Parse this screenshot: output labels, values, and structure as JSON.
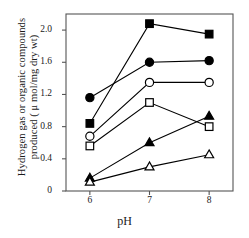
{
  "chart_data": {
    "type": "line",
    "title": "",
    "xlabel": "pH",
    "ylabel_line1": "Hydrogen gas or organic compounds",
    "ylabel_line2": "produced ( μ mol/mg dry wt)",
    "ylabel": "Hydrogen gas or organic compounds produced ( μ mol/mg dry wt)",
    "x": [
      6,
      7,
      8
    ],
    "xtick_labels": [
      "6",
      "7",
      "8"
    ],
    "ytick_labels": [
      "0",
      "0.4",
      "0.8",
      "1.2",
      "1.6",
      "2.0"
    ],
    "ytick_values": [
      0,
      0.4,
      0.8,
      1.2,
      1.6,
      2.0
    ],
    "xlim": [
      5.6,
      8.4
    ],
    "ylim": [
      0,
      2.2
    ],
    "grid": false,
    "legend": "none",
    "series": [
      {
        "name": "filled-square",
        "marker": "filled-square",
        "color": "#000000",
        "values": [
          0.84,
          2.08,
          1.95
        ]
      },
      {
        "name": "filled-circle",
        "marker": "filled-circle",
        "color": "#000000",
        "values": [
          1.16,
          1.6,
          1.62
        ]
      },
      {
        "name": "open-circle",
        "marker": "open-circle",
        "color": "#000000",
        "values": [
          0.68,
          1.35,
          1.35
        ]
      },
      {
        "name": "open-square",
        "marker": "open-square",
        "color": "#000000",
        "values": [
          0.56,
          1.1,
          0.8
        ]
      },
      {
        "name": "filled-triangle",
        "marker": "filled-triangle",
        "color": "#000000",
        "values": [
          0.16,
          0.6,
          0.93
        ]
      },
      {
        "name": "open-triangle",
        "marker": "open-triangle",
        "color": "#000000",
        "values": [
          0.11,
          0.3,
          0.45
        ]
      }
    ]
  },
  "axes": {
    "frame_color": "#555555",
    "tick_color": "#555555"
  }
}
